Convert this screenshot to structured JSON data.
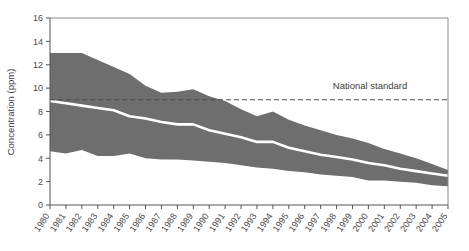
{
  "chart_data": {
    "type": "area",
    "title": "",
    "subtitle": "",
    "xlabel": "",
    "ylabel": "Concentration (ppm)",
    "ylim": [
      0,
      16
    ],
    "xlim": [
      1980,
      2005
    ],
    "yticks": [
      0,
      2,
      4,
      6,
      8,
      10,
      12,
      14,
      16
    ],
    "grid": false,
    "legend_position": "none",
    "categories": [
      "1980",
      "1981",
      "1982",
      "1983",
      "1984",
      "1985",
      "1986",
      "1987",
      "1988",
      "1989",
      "1990",
      "1991",
      "1992",
      "1993",
      "1994",
      "1995",
      "1996",
      "1997",
      "1998",
      "1999",
      "2000",
      "2001",
      "2002",
      "2003",
      "2004",
      "2005"
    ],
    "x": [
      1980,
      1981,
      1982,
      1983,
      1984,
      1985,
      1986,
      1987,
      1988,
      1989,
      1990,
      1991,
      1992,
      1993,
      1994,
      1995,
      1996,
      1997,
      1998,
      1999,
      2000,
      2001,
      2002,
      2003,
      2004,
      2005
    ],
    "series": [
      {
        "name": "90th percentile (upper bound)",
        "values": [
          13.0,
          13.0,
          13.0,
          12.4,
          11.8,
          11.2,
          10.2,
          9.6,
          9.7,
          9.9,
          9.3,
          8.9,
          8.2,
          7.6,
          8.0,
          7.3,
          6.8,
          6.4,
          6.0,
          5.7,
          5.3,
          4.8,
          4.4,
          4.0,
          3.5,
          3.0
        ]
      },
      {
        "name": "Median (mean concentration)",
        "values": [
          8.9,
          8.7,
          8.5,
          8.3,
          8.1,
          7.6,
          7.4,
          7.1,
          6.9,
          6.9,
          6.4,
          6.1,
          5.8,
          5.4,
          5.4,
          4.9,
          4.6,
          4.3,
          4.1,
          3.9,
          3.6,
          3.4,
          3.1,
          2.9,
          2.7,
          2.5
        ]
      },
      {
        "name": "10th percentile (lower bound)",
        "values": [
          4.6,
          4.4,
          4.7,
          4.2,
          4.2,
          4.4,
          4.0,
          3.9,
          3.9,
          3.8,
          3.7,
          3.6,
          3.4,
          3.2,
          3.1,
          2.9,
          2.8,
          2.6,
          2.5,
          2.4,
          2.1,
          2.1,
          2.0,
          1.9,
          1.7,
          1.6
        ]
      }
    ],
    "annotations": [
      {
        "name": "national-standard",
        "label": "National standard",
        "value": 9,
        "style": "dashed-horizontal-line"
      }
    ],
    "colors": {
      "band_fill": "#6e6e6e",
      "median_line": "#ffffff",
      "axis": "#555555",
      "text": "#3d3d3d",
      "standard_line": "#4a4a4a"
    }
  }
}
